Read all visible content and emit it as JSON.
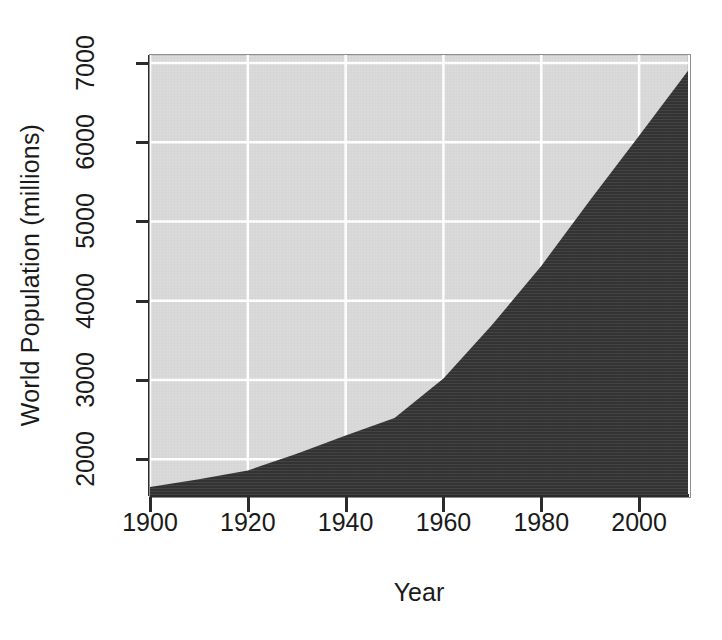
{
  "chart_data": {
    "type": "area",
    "title": "",
    "xlabel": "Year",
    "ylabel": "World Population (millions)",
    "xlim": [
      1900,
      2010
    ],
    "ylim": [
      1550,
      7100
    ],
    "xticks": [
      1900,
      1920,
      1940,
      1960,
      1980,
      2000
    ],
    "xtick_labels": [
      "1900",
      "1920",
      "1940",
      "1960",
      "1980",
      "2000"
    ],
    "yticks": [
      2000,
      3000,
      4000,
      5000,
      6000,
      7000
    ],
    "ytick_labels": [
      "2000",
      "3000",
      "4000",
      "5000",
      "6000",
      "7000"
    ],
    "grid": true,
    "grid_color": "#ffffff",
    "panel_color": "#d8d8d8",
    "fill_color": "#333333",
    "legend": null,
    "x": [
      1900,
      1910,
      1920,
      1930,
      1940,
      1950,
      1960,
      1970,
      1980,
      1990,
      2000,
      2010
    ],
    "values": [
      1650,
      1750,
      1860,
      2070,
      2300,
      2520,
      3020,
      3700,
      4440,
      5270,
      6080,
      6900
    ],
    "series": [
      {
        "name": "World Population (millions)",
        "values": [
          1650,
          1750,
          1860,
          2070,
          2300,
          2520,
          3020,
          3700,
          4440,
          5270,
          6080,
          6900
        ]
      }
    ]
  },
  "axes": {
    "y_title": "World Population (millions)",
    "x_title": "Year"
  }
}
